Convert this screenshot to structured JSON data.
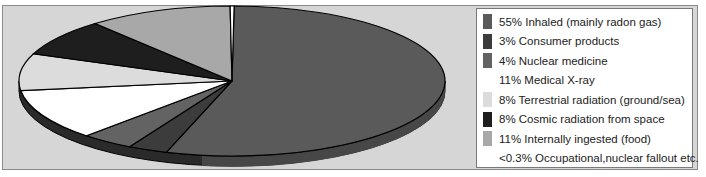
{
  "chart_data": {
    "type": "pie",
    "title": "",
    "legend_position": "right",
    "slices": [
      {
        "label": "Inhaled (mainly radon gas)",
        "pct_text": "55%",
        "value": 55,
        "color": "#5a5a5a"
      },
      {
        "label": "Consumer products",
        "pct_text": "3%",
        "value": 3,
        "color": "#3c3c3c"
      },
      {
        "label": "Nuclear medicine",
        "pct_text": "4%",
        "value": 4,
        "color": "#636363"
      },
      {
        "label": "Medical X-ray",
        "pct_text": "11%",
        "value": 11,
        "color": "#ffffff"
      },
      {
        "label": "Terrestrial radiation (ground/sea)",
        "pct_text": "8%",
        "value": 8,
        "color": "#dcdcdc"
      },
      {
        "label": "Cosmic radiation from space",
        "pct_text": "8%",
        "value": 8,
        "color": "#1e1e1e"
      },
      {
        "label": "Internally ingested (food)",
        "pct_text": "11%",
        "value": 11,
        "color": "#a8a8a8"
      },
      {
        "label": "Occupational,nuclear fallout etc.",
        "pct_text": "<0.3%",
        "value": 0.3,
        "color": "#ffffff"
      }
    ]
  },
  "legend": {
    "items": [
      {
        "text": "55% Inhaled (mainly radon gas)",
        "color": "#5a5a5a"
      },
      {
        "text": "3%   Consumer products",
        "color": "#3c3c3c"
      },
      {
        "text": "4%   Nuclear medicine",
        "color": "#636363"
      },
      {
        "text": "11% Medical X-ray",
        "color": "#ffffff"
      },
      {
        "text": "8%   Terrestrial radiation (ground/sea)",
        "color": "#dcdcdc"
      },
      {
        "text": "8%   Cosmic radiation from space",
        "color": "#1e1e1e"
      },
      {
        "text": "11% Internally ingested (food)",
        "color": "#a8a8a8"
      },
      {
        "text": "<0.3% Occupational,nuclear fallout etc.",
        "color": "#ffffff"
      }
    ]
  }
}
